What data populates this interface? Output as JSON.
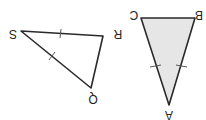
{
  "diagram": {
    "colors": {
      "stroke": "#2a2a2a",
      "shade": "#e6e6e6",
      "background": "#ffffff"
    },
    "triangles": [
      {
        "name": "SRQ",
        "shaded": false,
        "vertices": [
          {
            "label": "S",
            "x": 21,
            "y": 31,
            "lx": 13,
            "ly": 34
          },
          {
            "label": "R",
            "x": 103,
            "y": 36,
            "lx": 117,
            "ly": 34
          },
          {
            "label": "Q",
            "x": 91,
            "y": 88,
            "lx": 93,
            "ly": 99
          }
        ],
        "congruent_sides": [
          "SR",
          "SQ"
        ]
      },
      {
        "name": "ABC",
        "shaded": true,
        "vertices": [
          {
            "label": "C",
            "x": 141,
            "y": 18,
            "lx": 134,
            "ly": 15
          },
          {
            "label": "B",
            "x": 195,
            "y": 18,
            "lx": 200,
            "ly": 15
          },
          {
            "label": "A",
            "x": 169,
            "y": 105,
            "lx": 169,
            "ly": 116
          }
        ],
        "congruent_sides": [
          "CA",
          "BA"
        ]
      }
    ]
  },
  "labels": {
    "S": "S",
    "R": "R",
    "Q": "Q",
    "A": "A",
    "B": "B",
    "C": "C"
  }
}
